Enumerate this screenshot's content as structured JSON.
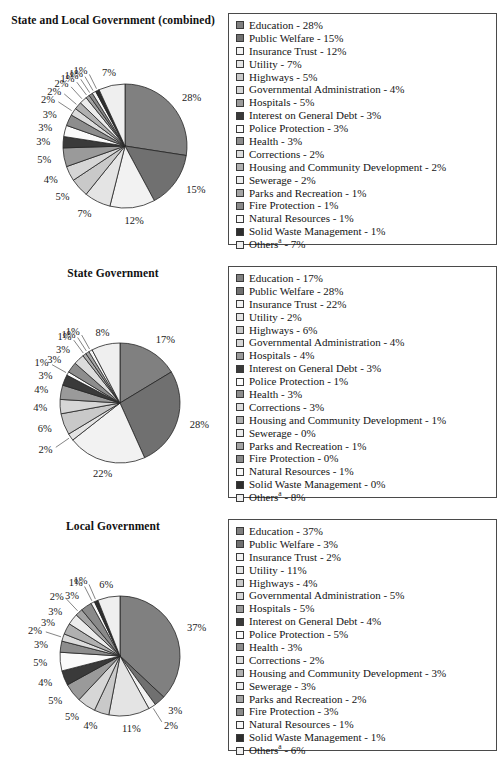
{
  "figure": {
    "note_marker": "a",
    "legend_border_color": "#4a4a4a"
  },
  "palette": {
    "education": "#808080",
    "public_welfare": "#707070",
    "insurance_trust": "#f2f2f2",
    "utility": "#e4e4e4",
    "highways": "#c9c9c9",
    "governmental_administration": "#d6d6d6",
    "hospitals": "#9a9a9a",
    "interest_on_general_debt": "#3a3a3a",
    "police_protection": "#fafafa",
    "health": "#8d8d8d",
    "corrections": "#dcdcdc",
    "housing_and_community_development": "#b0b0b0",
    "sewerage": "#ececec",
    "parks_and_recreation": "#a4a4a4",
    "fire_protection": "#8a8a8a",
    "natural_resources": "#f7f7f7",
    "solid_waste_management": "#2e2e2e",
    "others": "#efefef"
  },
  "charts": [
    {
      "id": "combined",
      "title": "State and Local Government (combined)",
      "chart_data": {
        "type": "pie",
        "title": "State and Local Government (combined)",
        "legend_position": "right",
        "unit": "%",
        "categories": [
          "Education",
          "Public Welfare",
          "Insurance Trust",
          "Utility",
          "Highways",
          "Governmental Administration",
          "Hospitals",
          "Interest on General Debt",
          "Police Protection",
          "Health",
          "Corrections",
          "Housing and Community Development",
          "Sewerage",
          "Parks and Recreation",
          "Fire Protection",
          "Natural Resources",
          "Solid Waste Management",
          "Others"
        ],
        "values": [
          28,
          15,
          12,
          7,
          5,
          4,
          5,
          3,
          3,
          3,
          2,
          2,
          2,
          1,
          1,
          1,
          1,
          7
        ],
        "labels": [
          "28%",
          "15%",
          "12%",
          "7%",
          "5%",
          "4%",
          "5%",
          "3%",
          "3%",
          "3%",
          "2%",
          "2%",
          "2%",
          "1%",
          "1%",
          "1%",
          "1%",
          "7%"
        ],
        "legend_entries": [
          "Education - 28%",
          "Public Welfare - 15%",
          "Insurance Trust - 12%",
          "Utility - 7%",
          "Highways - 5%",
          "Governmental Administration - 4%",
          "Hospitals - 5%",
          "Interest on General Debt - 3%",
          "Police Protection - 3%",
          "Health - 3%",
          "Corrections - 2%",
          "Housing and Community Development - 2%",
          "Sewerage - 2%",
          "Parks and Recreation - 1%",
          "Fire Protection - 1%",
          "Natural Resources - 1%",
          "Solid Waste Management - 1%",
          "Others - 7%"
        ]
      }
    },
    {
      "id": "state",
      "title": "State Government",
      "chart_data": {
        "type": "pie",
        "title": "State Government",
        "legend_position": "right",
        "unit": "%",
        "categories": [
          "Education",
          "Public Welfare",
          "Insurance Trust",
          "Utility",
          "Highways",
          "Governmental Administration",
          "Hospitals",
          "Interest on General Debt",
          "Police Protection",
          "Health",
          "Corrections",
          "Housing and Community Development",
          "Sewerage",
          "Parks and Recreation",
          "Fire Protection",
          "Natural Resources",
          "Solid Waste Management",
          "Others"
        ],
        "values": [
          17,
          28,
          22,
          2,
          6,
          4,
          4,
          3,
          1,
          3,
          3,
          1,
          0,
          1,
          0,
          1,
          0,
          8
        ],
        "labels": [
          "17%",
          "28%",
          "22%",
          "2%",
          "6%",
          "4%",
          "4%",
          "3%",
          "1%",
          "3%",
          "3%",
          "1%",
          "",
          "1%",
          "",
          "1%",
          "",
          "8%"
        ],
        "legend_entries": [
          "Education - 17%",
          "Public Welfare - 28%",
          "Insurance Trust - 22%",
          "Utility - 2%",
          "Highways - 6%",
          "Governmental Administration - 4%",
          "Hospitals - 4%",
          "Interest on General Debt - 3%",
          "Police Protection - 1%",
          "Health - 3%",
          "Corrections - 3%",
          "Housing and Community Development - 1%",
          "Sewerage - 0%",
          "Parks and Recreation - 1%",
          "Fire Protection - 0%",
          "Natural Resources - 1%",
          "Solid Waste Management - 0%",
          "Others - 8%"
        ]
      }
    },
    {
      "id": "local",
      "title": "Local Government",
      "chart_data": {
        "type": "pie",
        "title": "Local Government",
        "legend_position": "right",
        "unit": "%",
        "categories": [
          "Education",
          "Public Welfare",
          "Insurance Trust",
          "Utility",
          "Highways",
          "Governmental Administration",
          "Hospitals",
          "Interest on General Debt",
          "Police Protection",
          "Health",
          "Corrections",
          "Housing and Community Development",
          "Sewerage",
          "Parks and Recreation",
          "Fire Protection",
          "Natural Resources",
          "Solid Waste Management",
          "Others"
        ],
        "values": [
          37,
          3,
          2,
          11,
          4,
          5,
          5,
          4,
          5,
          3,
          2,
          3,
          3,
          2,
          3,
          1,
          1,
          6
        ],
        "labels": [
          "37%",
          "3%",
          "2%",
          "11%",
          "4%",
          "5%",
          "5%",
          "4%",
          "5%",
          "3%",
          "2%",
          "3%",
          "3%",
          "2%",
          "3%",
          "1%",
          "1%",
          "6%"
        ],
        "legend_entries": [
          "Education - 37%",
          "Public Welfare - 3%",
          "Insurance Trust - 2%",
          "Utility - 11%",
          "Highways - 4%",
          "Governmental Administration - 5%",
          "Hospitals - 5%",
          "Interest on General Debt - 4%",
          "Police Protection - 5%",
          "Health - 3%",
          "Corrections - 2%",
          "Housing and Community Development - 3%",
          "Sewerage - 3%",
          "Parks and Recreation - 2%",
          "Fire Protection - 3%",
          "Natural Resources - 1%",
          "Solid Waste Management - 1%",
          "Others - 6%"
        ]
      }
    }
  ]
}
